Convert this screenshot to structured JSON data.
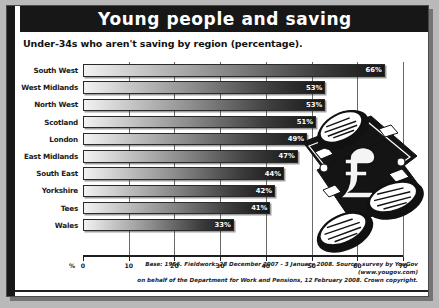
{
  "header": {
    "title": "Young people and saving"
  },
  "subtitle": "Under-34s who aren't saving by region (percentage).",
  "axis": {
    "unit_label": "%",
    "ticks": [
      "0",
      "10",
      "20",
      "30",
      "40",
      "50",
      "60",
      "70"
    ]
  },
  "footnote": {
    "line1": "Base: 1956. Fieldwork: 28 December 2007 - 3 January 2008. Source: survey by YouGov (www.yougov.com)",
    "line2": "on behalf of the Department for Work and Pensions, 12 February 2008. Crown copyright."
  },
  "art": {
    "name": "banknotes-and-coins-illustration"
  },
  "chart_data": {
    "type": "bar",
    "orientation": "horizontal",
    "title": "Young people and saving",
    "subtitle": "Under-34s who aren't saving by region (percentage).",
    "xlabel": "%",
    "ylabel": "",
    "xlim": [
      0,
      70
    ],
    "grid": true,
    "legend": "none",
    "categories": [
      "South West",
      "West Midlands",
      "North West",
      "Scotland",
      "London",
      "East Midlands",
      "South East",
      "Yorkshire",
      "Tees",
      "Wales"
    ],
    "values": [
      66,
      53,
      53,
      51,
      49,
      47,
      44,
      42,
      41,
      33
    ],
    "value_labels": [
      "66%",
      "53%",
      "53%",
      "51%",
      "49%",
      "47%",
      "44%",
      "42%",
      "41%",
      "33%"
    ],
    "source": "Base: 1956. Fieldwork: 28 December 2007 - 3 January 2008. Source: survey by YouGov (www.yougov.com) on behalf of the Department for Work and Pensions, 12 February 2008. Crown copyright."
  },
  "colors": {
    "banner_background": "#171717",
    "banner_text": "#ffffff",
    "card_background": "#ffffff",
    "page_background": "#b9b9b9",
    "bar_dark": "#161616",
    "bar_light": "#f2f2f2",
    "axis": "#1f1f1f"
  }
}
